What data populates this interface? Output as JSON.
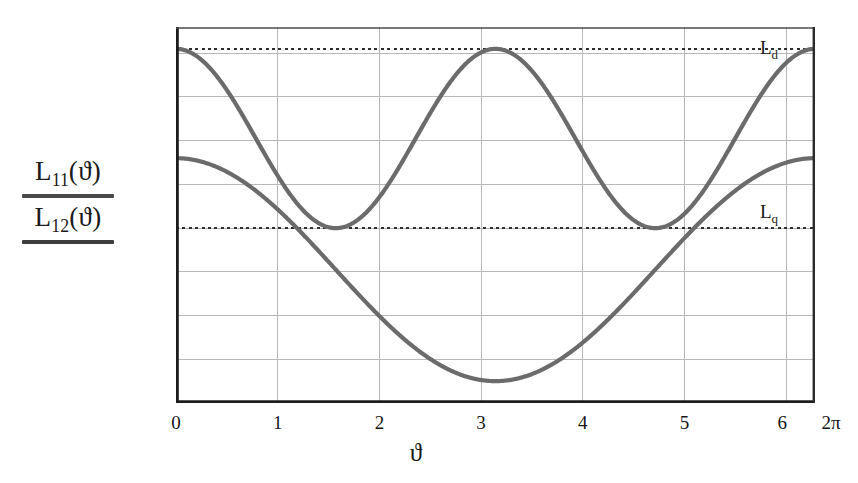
{
  "chart_data": {
    "type": "line",
    "title": "",
    "xlabel": "ϑ",
    "ylabel": "L11(ϑ) / L12(ϑ)",
    "xlim": [
      0,
      6.2831853
    ],
    "ylim": [
      -0.006,
      0.0112
    ],
    "grid": true,
    "legend_position": "inline-right",
    "x_tick_labels": [
      "0",
      "1",
      "2",
      "3",
      "4",
      "5",
      "6",
      "2π"
    ],
    "x_tick_values": [
      0,
      1,
      2,
      3,
      4,
      5,
      6,
      6.2831853
    ],
    "y_tick_labels": [
      "0.01",
      "0.008",
      "0.006",
      "0.004",
      "0.002",
      "0",
      "-0.002",
      "-0.004",
      "-0.006"
    ],
    "y_tick_values": [
      0.01,
      0.008,
      0.006,
      0.004,
      0.002,
      0,
      -0.002,
      -0.004,
      -0.006
    ],
    "series": [
      {
        "name": "L11(ϑ)",
        "formula": "0.0061 + 0.0041*cos(2*x)",
        "color": "#6b6b6b",
        "max_value": 0.0102,
        "min_value": 0.002,
        "maxima_at": [
          0,
          3.1416,
          6.2832
        ],
        "minima_at": [
          1.5708,
          4.7124
        ]
      },
      {
        "name": "L12(ϑ)",
        "formula": "0.0001 + 0.0051*cos(x)",
        "color": "#6b6b6b",
        "max_value": 0.0052,
        "min_value": -0.005,
        "maxima_at": [
          0,
          6.2832
        ],
        "minima_at": [
          3.1416
        ]
      }
    ],
    "reference_lines": [
      {
        "label": "L_d",
        "value": 0.0102,
        "style": "dashed",
        "color": "#333333"
      },
      {
        "label": "L_q",
        "value": 0.002,
        "style": "dashed",
        "color": "#333333"
      }
    ],
    "annotations": [
      {
        "name": "Ld",
        "base": "L",
        "sub": "d",
        "value": 0.0102
      },
      {
        "name": "Lq",
        "base": "L",
        "sub": "q",
        "value": 0.002
      }
    ]
  },
  "axis_label": {
    "numerator": {
      "base": "L",
      "sub": "11",
      "arg": "(ϑ)"
    },
    "denominator": {
      "base": "L",
      "sub": "12",
      "arg": "(ϑ)"
    }
  },
  "xlabel_text": "ϑ",
  "ticks": {
    "y": [
      {
        "label": "0.01",
        "value": 0.01
      },
      {
        "label": "0.008",
        "value": 0.008
      },
      {
        "label": "0.006",
        "value": 0.006
      },
      {
        "label": "0.004",
        "value": 0.004
      },
      {
        "label": "0.002",
        "value": 0.002
      },
      {
        "label": "0",
        "value": 0
      },
      {
        "label": "−0.002",
        "value": -0.002
      },
      {
        "label": "−0.004",
        "value": -0.004
      },
      {
        "label": "−0.006",
        "value": -0.006
      }
    ],
    "x": [
      {
        "label": "0",
        "value": 0
      },
      {
        "label": "1",
        "value": 1
      },
      {
        "label": "2",
        "value": 2
      },
      {
        "label": "3",
        "value": 3
      },
      {
        "label": "4",
        "value": 4
      },
      {
        "label": "5",
        "value": 5
      },
      {
        "label": "6",
        "value": 6
      },
      {
        "label": "2π",
        "value": 6.2831853
      }
    ]
  },
  "annotation_labels": {
    "ld_base": "L",
    "ld_sub": "d",
    "lq_base": "L",
    "lq_sub": "q"
  },
  "colors": {
    "curve": "#6b6b6b",
    "grid": "#b9b9b9",
    "frame": "#1c1c1c",
    "dashed": "#2f2f2f",
    "text": "#151515",
    "background": "#ffffff"
  }
}
